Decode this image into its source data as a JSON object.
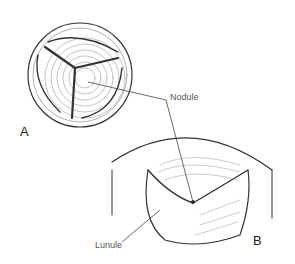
{
  "figure": {
    "panel_a_label": "A",
    "panel_b_label": "B",
    "callouts": {
      "nodule": "Nodule",
      "lunule": "Lunule"
    },
    "colors": {
      "ink": "#333333",
      "background": "#ffffff"
    }
  }
}
